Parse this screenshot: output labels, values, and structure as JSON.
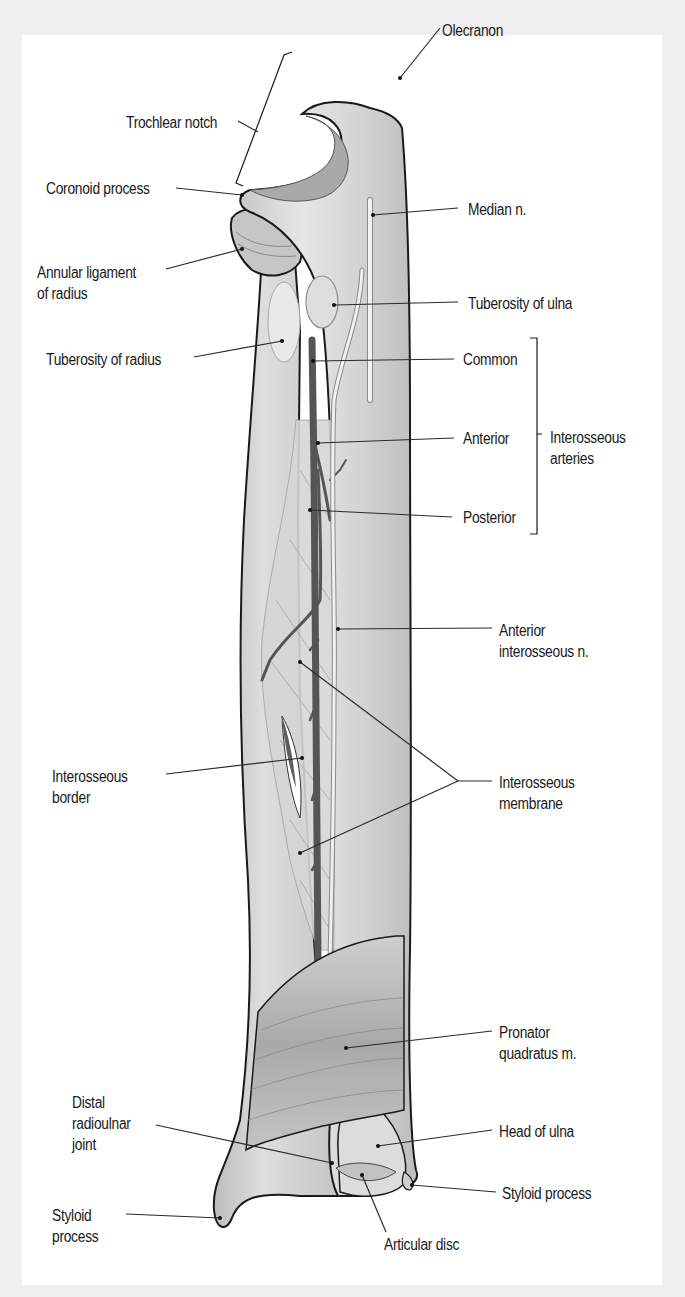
{
  "figure": {
    "colors": {
      "background": "#efefef",
      "panel": "#ffffff",
      "bone_fill": "#d9d9d9",
      "bone_shade": "#b5b5b5",
      "outline": "#1a1a1a",
      "artery": "#5a5a5a",
      "nerve": "#eeeeee",
      "leader_line": "#2a2a2a"
    }
  },
  "labels": {
    "olecranon": "Olecranon",
    "trochlear_notch": "Trochlear notch",
    "coronoid_process": "Coronoid process",
    "median_n": "Median n.",
    "annular_ligament_l1": "Annular ligament",
    "annular_ligament_l2": "of radius",
    "tuberosity_ulna": "Tuberosity of ulna",
    "tuberosity_radius": "Tuberosity of radius",
    "common": "Common",
    "anterior": "Anterior",
    "posterior": "Posterior",
    "interosseous_arteries_l1": "Interosseous",
    "interosseous_arteries_l2": "arteries",
    "anterior_interosseous_n_l1": "Anterior",
    "anterior_interosseous_n_l2": "interosseous n.",
    "interosseous_border_l1": "Interosseous",
    "interosseous_border_l2": "border",
    "interosseous_membrane_l1": "Interosseous",
    "interosseous_membrane_l2": "membrane",
    "pronator_quadratus_l1": "Pronator",
    "pronator_quadratus_l2": "quadratus m.",
    "distal_radioulnar_l1": "Distal",
    "distal_radioulnar_l2": "radioulnar",
    "distal_radioulnar_l3": "joint",
    "head_of_ulna": "Head of ulna",
    "styloid_process_ulna": "Styloid process",
    "styloid_process_radius_l1": "Styloid",
    "styloid_process_radius_l2": "process",
    "articular_disc": "Articular disc"
  }
}
